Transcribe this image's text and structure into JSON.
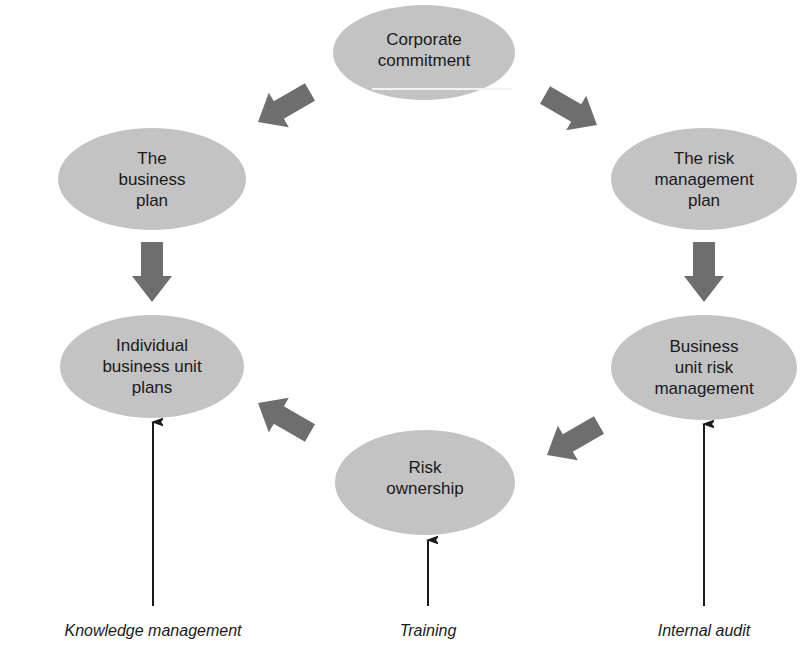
{
  "diagram": {
    "type": "cycle",
    "colors": {
      "node_fill": "#c3c3c3",
      "block_arrow": "#6e6e6e",
      "thin_arrow": "#1a1a1a",
      "text": "#1a1a1a",
      "background": "#ffffff"
    },
    "nodes": [
      {
        "id": "corporate-commitment",
        "label": "Corporate\ncommitment"
      },
      {
        "id": "risk-management-plan",
        "label": "The risk\nmanagement\nplan"
      },
      {
        "id": "business-unit-risk-management",
        "label": "Business\nunit risk\nmanagement"
      },
      {
        "id": "risk-ownership",
        "label": "Risk\nownership"
      },
      {
        "id": "individual-business-unit-plans",
        "label": "Individual\nbusiness unit\nplans"
      },
      {
        "id": "business-plan",
        "label": "The\nbusiness\nplan"
      }
    ],
    "edges": [
      {
        "from": "corporate-commitment",
        "to": "business-plan"
      },
      {
        "from": "corporate-commitment",
        "to": "risk-management-plan"
      },
      {
        "from": "business-plan",
        "to": "individual-business-unit-plans"
      },
      {
        "from": "risk-management-plan",
        "to": "business-unit-risk-management"
      },
      {
        "from": "business-unit-risk-management",
        "to": "risk-ownership"
      },
      {
        "from": "risk-ownership",
        "to": "individual-business-unit-plans"
      }
    ],
    "inputs": [
      {
        "label": "Knowledge management",
        "to": "individual-business-unit-plans"
      },
      {
        "label": "Training",
        "to": "risk-ownership"
      },
      {
        "label": "Internal audit",
        "to": "business-unit-risk-management"
      }
    ]
  }
}
